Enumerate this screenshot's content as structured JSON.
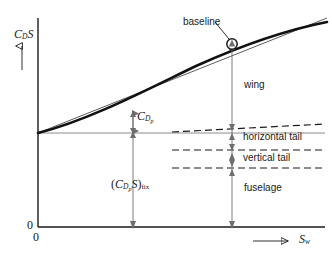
{
  "figure": {
    "title_text": "",
    "background_color": "#ffffff",
    "ink_color": "#1a1a1a",
    "axes": {
      "y_axis_label": "C",
      "y_axis_label_sub": "D",
      "y_axis_label_tail": "S",
      "y_axis_arrow_name": "up-arrow",
      "x_axis_label": "S",
      "x_axis_label_sub": "w",
      "x_axis_arrow_name": "right-arrow",
      "origin_label_x": "0",
      "origin_label_y": "0"
    },
    "annotations": [
      {
        "id": "baseline",
        "label": "baseline",
        "x": 183,
        "y": 22
      },
      {
        "id": "wing",
        "label": "wing",
        "x": 244,
        "y": 85
      },
      {
        "id": "horizontal-tail",
        "label": "horizontal tail",
        "x": 243,
        "y": 137
      },
      {
        "id": "vertical-tail",
        "label": "vertical tail",
        "x": 243,
        "y": 158
      },
      {
        "id": "fuselage",
        "label": "fuselage",
        "x": 244,
        "y": 188
      }
    ],
    "math_labels": {
      "cdp": {
        "main": "C",
        "sub": "D",
        "subsub": "p",
        "x": 117,
        "y": 114
      },
      "cdps_fix": {
        "open": "(",
        "main": "C",
        "sub": "D",
        "subsub": "p",
        "mid": "S",
        "close": ")",
        "fix": "fix",
        "x": 113,
        "y": 184
      }
    },
    "curves": {
      "total_drag_curve_name": "total-drag-curve",
      "baseline_straight_line_name": "baseline-tangent-line"
    },
    "measure_arrows": [
      {
        "id": "cdp-measure",
        "x": 133,
        "y_top": 112,
        "y_bottom": 133
      },
      {
        "id": "breakdown-measure",
        "x": 232,
        "y_top": 44,
        "y_bottom": 227
      },
      {
        "id": "cdps-fix-measure",
        "x": 133,
        "y_top": 133,
        "y_bottom": 227
      }
    ],
    "component_dividers": [
      {
        "id": "wing-horizontal-tail-divider",
        "style": "dashed",
        "sloped": true
      },
      {
        "id": "horizontal-vertical-tail-divider",
        "style": "dashed",
        "sloped": false
      },
      {
        "id": "vertical-tail-fuselage-divider",
        "style": "dashed",
        "sloped": false
      }
    ]
  }
}
